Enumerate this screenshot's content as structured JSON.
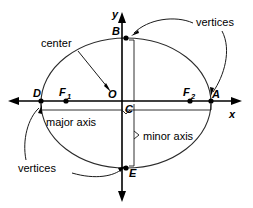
{
  "figure": {
    "background_color": "#ffffff",
    "stroke_color": "#1a1a1a"
  },
  "axes": {
    "x_label": "x",
    "y_label": "y",
    "origin_label": "O",
    "center_mark_label": "C"
  },
  "points": [
    {
      "id": "B",
      "label": "B",
      "role": "minor-axis-endpoint-top"
    },
    {
      "id": "D",
      "label": "D",
      "role": "major-axis-vertex-left"
    },
    {
      "id": "A",
      "label": "A",
      "role": "major-axis-vertex-right"
    },
    {
      "id": "E",
      "label": "E",
      "role": "minor-axis-endpoint-bottom"
    },
    {
      "id": "F1",
      "label": "F",
      "subscript": "1",
      "role": "focus-left"
    },
    {
      "id": "F2",
      "label": "F",
      "subscript": "2",
      "role": "focus-right"
    }
  ],
  "annotations": {
    "center": "center",
    "vertices_top_right": "vertices",
    "vertices_bottom_left": "vertices",
    "major_axis": "major axis",
    "minor_axis": "minor axis"
  },
  "geometry": {
    "ellipse_center_x": 126,
    "ellipse_center_y": 103,
    "semi_major": 85,
    "semi_minor": 65
  }
}
